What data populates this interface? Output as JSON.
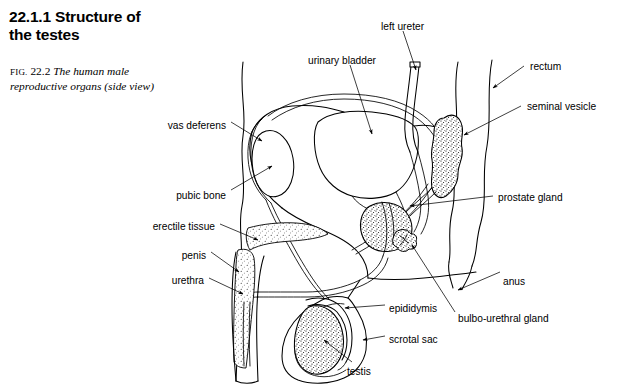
{
  "figure": {
    "section_number": "22.1.1",
    "section_title_line1": "22.1.1  Structure of",
    "section_title_line2": "the testes",
    "caption_prefix": "FIG.",
    "caption_number": "22.2",
    "caption_text_line1": "The human male",
    "caption_text_line2": "reproductive organs (side view)",
    "title_full": "22.1.1 Structure of the testes",
    "subject": "The human male reproductive organs (side view)"
  },
  "colors": {
    "background": "#ffffff",
    "ink": "#000000",
    "stipple": "#000000"
  },
  "labels": [
    {
      "id": "left-ureter",
      "text": "left ureter",
      "align": "left",
      "x": 381,
      "y": 21
    },
    {
      "id": "urinary-bladder",
      "text": "urinary bladder",
      "align": "left",
      "x": 308,
      "y": 55
    },
    {
      "id": "rectum",
      "text": "rectum",
      "align": "left",
      "x": 530,
      "y": 61
    },
    {
      "id": "seminal-vesicle",
      "text": "seminal vesicle",
      "align": "left",
      "x": 527,
      "y": 101
    },
    {
      "id": "prostate-gland",
      "text": "prostate gland",
      "align": "left",
      "x": 498,
      "y": 192
    },
    {
      "id": "anus",
      "text": "anus",
      "align": "left",
      "x": 503,
      "y": 276
    },
    {
      "id": "bulbo-urethral-gland",
      "text": "bulbo-urethral gland",
      "align": "left",
      "x": 458,
      "y": 313
    },
    {
      "id": "epididymis",
      "text": "epididymis",
      "align": "left",
      "x": 389,
      "y": 303
    },
    {
      "id": "scrotal-sac",
      "text": "scrotal sac",
      "align": "left",
      "x": 389,
      "y": 334
    },
    {
      "id": "testis",
      "text": "testis",
      "align": "left",
      "x": 347,
      "y": 366
    },
    {
      "id": "vas-deferens",
      "text": "vas deferens",
      "align": "right",
      "x": 226,
      "y": 120
    },
    {
      "id": "pubic-bone",
      "text": "pubic bone",
      "align": "right",
      "x": 226,
      "y": 190
    },
    {
      "id": "erectile-tissue",
      "text": "erectile tissue",
      "align": "right",
      "x": 215,
      "y": 221
    },
    {
      "id": "penis",
      "text": "penis",
      "align": "right",
      "x": 206,
      "y": 250
    },
    {
      "id": "urethra",
      "text": "urethra",
      "align": "right",
      "x": 204,
      "y": 275
    }
  ],
  "structures": [
    {
      "id": "abdominal-wall",
      "name": "abdominal wall outline",
      "shaded": false
    },
    {
      "id": "urinary-bladder",
      "name": "urinary bladder",
      "shaded": false
    },
    {
      "id": "left-ureter",
      "name": "left ureter",
      "shaded": false
    },
    {
      "id": "pubic-bone",
      "name": "pubic bone",
      "shaded": false
    },
    {
      "id": "vas-deferens",
      "name": "vas deferens",
      "shaded": false
    },
    {
      "id": "seminal-vesicle",
      "name": "seminal vesicle",
      "shaded": true
    },
    {
      "id": "prostate-gland",
      "name": "prostate gland",
      "shaded": true
    },
    {
      "id": "bulbo-urethral-gland",
      "name": "bulbo-urethral gland",
      "shaded": true
    },
    {
      "id": "rectum",
      "name": "rectum",
      "shaded": false
    },
    {
      "id": "anus",
      "name": "anus",
      "shaded": false
    },
    {
      "id": "erectile-tissue",
      "name": "erectile tissue",
      "shaded": true
    },
    {
      "id": "urethra",
      "name": "urethra",
      "shaded": false
    },
    {
      "id": "penis",
      "name": "penis",
      "shaded": false
    },
    {
      "id": "testis",
      "name": "testis",
      "shaded": true
    },
    {
      "id": "epididymis",
      "name": "epididymis",
      "shaded": false
    },
    {
      "id": "scrotal-sac",
      "name": "scrotal sac",
      "shaded": false
    }
  ]
}
